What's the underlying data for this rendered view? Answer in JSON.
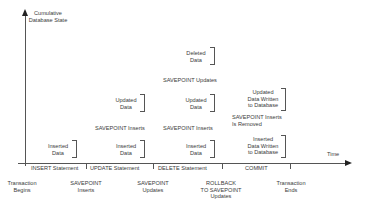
{
  "diagram": {
    "y_axis_label": [
      "Cumulative",
      "Database State"
    ],
    "x_axis_label": "Time",
    "statements": [
      {
        "label": "INSERT Statement"
      },
      {
        "label": "UPDATE Statement"
      },
      {
        "label": "DELETE Statement"
      },
      {
        "label": "COMMIT"
      }
    ],
    "events": [
      {
        "label": [
          "Transaction",
          "Begins"
        ]
      },
      {
        "label": [
          "SAVEPOINT",
          "Inserts"
        ]
      },
      {
        "label": [
          "SAVEPOINT",
          "Updates"
        ]
      },
      {
        "label": [
          "ROLLBACK",
          "TO SAVEPOINT",
          "Updates"
        ]
      },
      {
        "label": [
          "Transaction",
          "Ends"
        ]
      }
    ],
    "column1": {
      "block1": [
        "Inserted",
        "Data"
      ]
    },
    "column2": {
      "block1": [
        "Inserted",
        "Data"
      ],
      "savepoint": "SAVEPOINT Inserts",
      "block2": [
        "Updated",
        "Data"
      ]
    },
    "column3": {
      "block1": [
        "Inserted",
        "Data"
      ],
      "savepoint1": "SAVEPOINT Inserts",
      "block2": [
        "Updated",
        "Data"
      ],
      "savepoint2": "SAVEPOINT Updates",
      "block3": [
        "Deleted",
        "Data"
      ]
    },
    "column4": {
      "block1": [
        "Inserted",
        "Data Written",
        "to Database"
      ],
      "note": [
        "SAVEPOINT Inserts",
        "Is Removed"
      ],
      "block2": [
        "Updated",
        "Data Written",
        "to Database"
      ]
    }
  }
}
